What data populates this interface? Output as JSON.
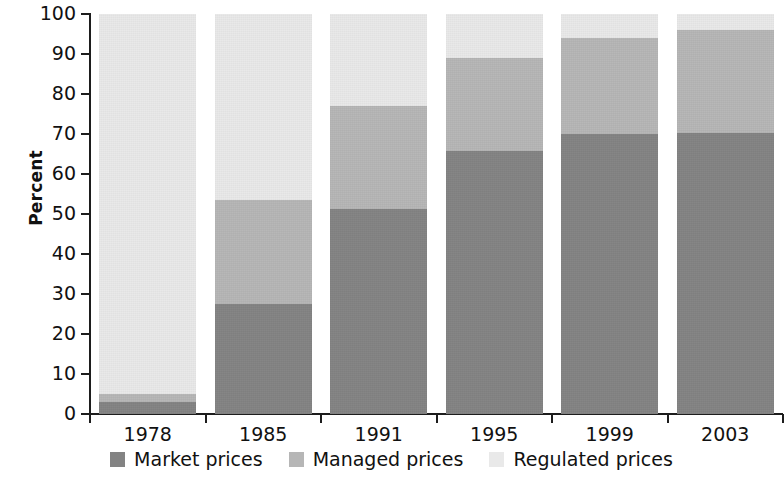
{
  "chart_data": {
    "type": "bar",
    "subtype": "stacked-bar-100",
    "title": "",
    "xlabel": "",
    "ylabel": "Percent",
    "ylim": [
      0,
      100
    ],
    "yticks": [
      0,
      10,
      20,
      30,
      40,
      50,
      60,
      70,
      80,
      90,
      100
    ],
    "grid": false,
    "legend_position": "bottom-center",
    "categories": [
      "1978",
      "1985",
      "1991",
      "1995",
      "1999",
      "2003"
    ],
    "series": [
      {
        "name": "Market prices",
        "color": "#838383",
        "values": [
          3,
          27.5,
          51.3,
          65.8,
          70,
          70.3
        ]
      },
      {
        "name": "Managed prices",
        "color": "#b6b6b6",
        "values": [
          2,
          26,
          25.7,
          23.2,
          24,
          25.7
        ]
      },
      {
        "name": "Regulated prices",
        "color": "#e9e9e9",
        "values": [
          95,
          46.5,
          23,
          11,
          6,
          4
        ]
      }
    ],
    "cumulative_tops": {
      "market": [
        3,
        27.5,
        51.3,
        65.8,
        70,
        70.3
      ],
      "managed": [
        5,
        53.5,
        77,
        89,
        94,
        96
      ],
      "regulated": [
        100,
        100,
        100,
        100,
        100,
        100
      ]
    }
  },
  "axis": {
    "y_title": "Percent",
    "y_tick_labels": [
      "100",
      "90",
      "80",
      "70",
      "60",
      "50",
      "40",
      "30",
      "20",
      "10",
      "0"
    ],
    "x_tick_labels": [
      "1978",
      "1985",
      "1991",
      "1995",
      "1999",
      "2003"
    ]
  },
  "legend": {
    "items": [
      {
        "label": "Market prices",
        "color": "#838383"
      },
      {
        "label": "Managed prices",
        "color": "#b6b6b6"
      },
      {
        "label": "Regulated prices",
        "color": "#e9e9e9"
      }
    ]
  }
}
